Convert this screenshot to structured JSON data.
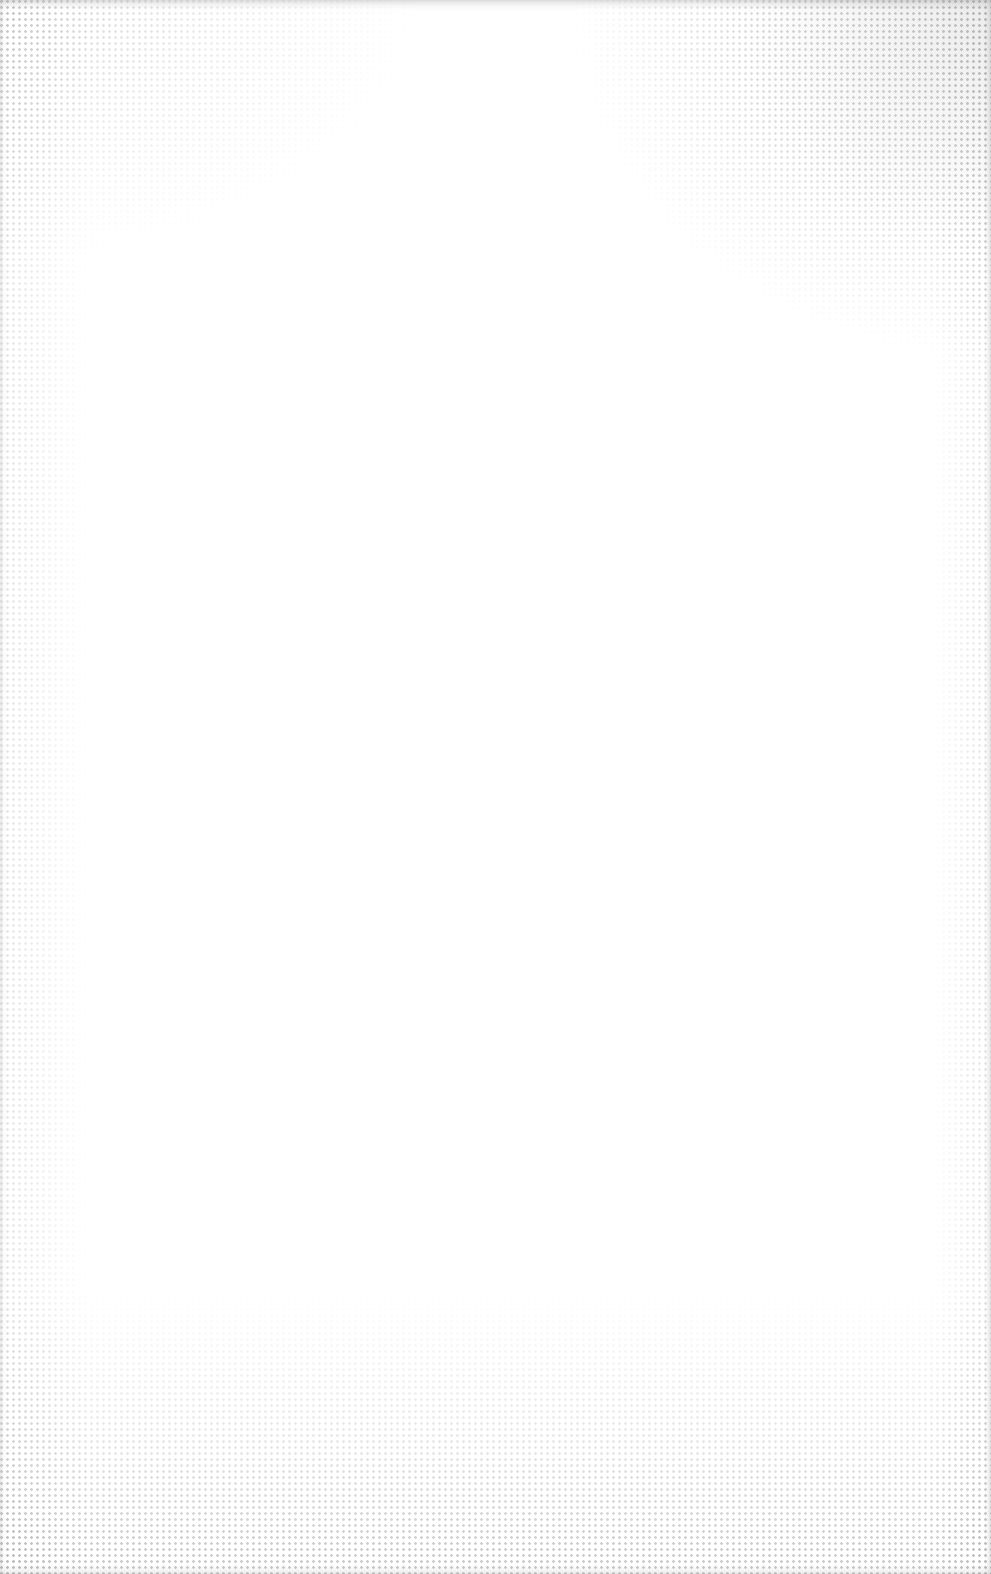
{
  "surface": {
    "description": "blank textured paper / canvas",
    "base_color": "#ffffff",
    "texture_color": "#8a8a8a"
  }
}
